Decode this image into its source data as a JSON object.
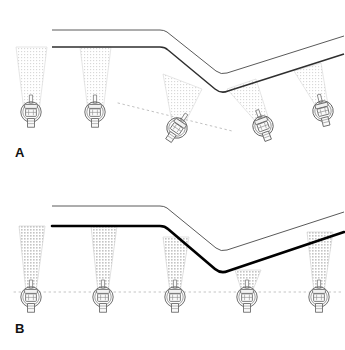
{
  "figure": {
    "width": 345,
    "height": 350,
    "background_color": "#ffffff"
  },
  "colors": {
    "ink": "#1a1a1a",
    "ceiling_line_thin": "#3a3a3a",
    "ceiling_line_heavy": "#000000",
    "beam_fill_light": "#efefef",
    "beam_fill_medium": "#e2e2e2",
    "beam_edge": "#cfcfcf",
    "dotted_guide": "#b9b9b9",
    "fixture_stroke": "#555555",
    "fixture_fill": "#fdfdfd"
  },
  "panels": [
    {
      "id": "A",
      "label": "A",
      "label_name": "panel-label-a",
      "caption_hidden": "Fixtures aimed perpendicular to the ceiling surface; heads tilt with the slope and mounting heights step along the fold.",
      "ceiling": {
        "style": "thin",
        "upper_edge": [
          [
            52,
            30
          ],
          [
            160,
            30
          ],
          [
            222,
            74
          ],
          [
            283,
            52
          ],
          [
            344,
            36
          ]
        ],
        "lower_edge": [
          [
            52,
            47
          ],
          [
            160,
            47
          ],
          [
            222,
            92
          ],
          [
            283,
            70
          ],
          [
            344,
            54
          ]
        ],
        "fold_type": "valley",
        "vertex_x": 222
      },
      "guide_line": {
        "visible": true,
        "style": "dotted",
        "orientation": "sloped",
        "points": [
          [
            120,
            103
          ],
          [
            222,
            128
          ]
        ]
      },
      "fixtures": [
        {
          "index": 1,
          "x": 31,
          "y": 112,
          "tilt_deg": 0,
          "beam_spread_deg": 26,
          "beam_shade": "light"
        },
        {
          "index": 2,
          "x": 95,
          "y": 112,
          "tilt_deg": 0,
          "beam_spread_deg": 26,
          "beam_shade": "light"
        },
        {
          "index": 3,
          "x": 176,
          "y": 128,
          "tilt_deg": 34,
          "beam_spread_deg": 26,
          "beam_shade": "light"
        },
        {
          "index": 4,
          "x": 262,
          "y": 125,
          "tilt_deg": -20,
          "beam_spread_deg": 24,
          "beam_shade": "light"
        },
        {
          "index": 5,
          "x": 322,
          "y": 110,
          "tilt_deg": -14,
          "beam_spread_deg": 24,
          "beam_shade": "light"
        }
      ]
    },
    {
      "id": "B",
      "label": "B",
      "label_name": "panel-label-b",
      "caption_hidden": "Fixtures hung on a single level plane with vertical downward beams; the heavy ceiling edge shows the unlit slope.",
      "ceiling": {
        "style": "heavy",
        "upper_edge": [
          [
            52,
            31
          ],
          [
            160,
            31
          ],
          [
            222,
            76
          ],
          [
            283,
            53
          ],
          [
            344,
            37
          ]
        ],
        "lower_edge": [
          [
            52,
            51
          ],
          [
            160,
            51
          ],
          [
            222,
            97
          ],
          [
            283,
            74
          ],
          [
            344,
            57
          ]
        ],
        "fold_type": "valley",
        "vertex_x": 222
      },
      "guide_line": {
        "visible": true,
        "style": "dotted",
        "orientation": "horizontal",
        "points": [
          [
            14,
            117
          ],
          [
            341,
            117
          ]
        ]
      },
      "fixtures": [
        {
          "index": 1,
          "x": 31,
          "y": 122,
          "tilt_deg": 0,
          "beam_spread_deg": 16,
          "beam_shade": "medium"
        },
        {
          "index": 2,
          "x": 103,
          "y": 122,
          "tilt_deg": 0,
          "beam_spread_deg": 16,
          "beam_shade": "medium"
        },
        {
          "index": 3,
          "x": 175,
          "y": 122,
          "tilt_deg": 0,
          "beam_spread_deg": 16,
          "beam_shade": "medium"
        },
        {
          "index": 4,
          "x": 247,
          "y": 122,
          "tilt_deg": 0,
          "beam_spread_deg": 16,
          "beam_shade": "medium"
        },
        {
          "index": 5,
          "x": 319,
          "y": 122,
          "tilt_deg": 0,
          "beam_spread_deg": 16,
          "beam_shade": "medium"
        }
      ]
    }
  ]
}
